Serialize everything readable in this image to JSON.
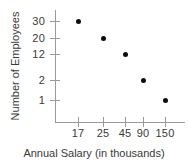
{
  "chart_data": {
    "type": "scatter",
    "title": "",
    "xlabel": "Annual Salary (in thousands)",
    "ylabel": "Number of Employees",
    "grid": false,
    "legend": null,
    "x_tick_labels": [
      "17",
      "25",
      "45",
      "90",
      "150"
    ],
    "y_tick_labels": [
      "30",
      "20",
      "12",
      "2",
      "1"
    ],
    "x_axis_note": "category-style axis, ticks unevenly valued",
    "y_axis_note": "non-linear tick spacing, values decrease downward",
    "points": [
      {
        "x": "17",
        "y": "30",
        "px": 78,
        "py": 21
      },
      {
        "x": "25",
        "y": "20",
        "px": 103,
        "py": 38
      },
      {
        "x": "45",
        "y": "12",
        "px": 125,
        "py": 54
      },
      {
        "x": "90",
        "y": "2",
        "px": 143,
        "py": 80
      },
      {
        "x": "150",
        "y": "1",
        "px": 165,
        "py": 100
      }
    ],
    "x_ticks_px": [
      78,
      103,
      125,
      143,
      165
    ],
    "y_ticks_px": [
      21,
      38,
      54,
      80,
      100
    ],
    "colors": {
      "marker": "#0d0d0d",
      "axis": "#9a9a9a",
      "text": "#3a3a3a",
      "background": "#ffffff"
    }
  }
}
